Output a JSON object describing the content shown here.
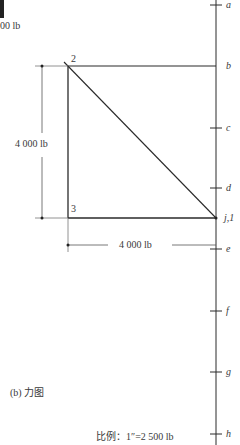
{
  "top_fragment": {
    "text": "00 lb"
  },
  "nodes": [
    {
      "id": "2",
      "label": "2"
    },
    {
      "id": "3",
      "label": "3"
    }
  ],
  "dimensions": {
    "vertical": "4 000 lb",
    "horizontal": "4 000 lb"
  },
  "load_line_ticks": [
    {
      "label": "a"
    },
    {
      "label": "b"
    },
    {
      "label": "c"
    },
    {
      "label": "d"
    },
    {
      "label": "j,1"
    },
    {
      "label": "e"
    },
    {
      "label": "f"
    },
    {
      "label": "g"
    },
    {
      "label": "h"
    }
  ],
  "caption": "(b) 力图",
  "scale": "比例：1″=2 500 lb",
  "colors": {
    "line": "#2a2a2a",
    "dim_line": "#555555",
    "background": "#ffffff"
  }
}
